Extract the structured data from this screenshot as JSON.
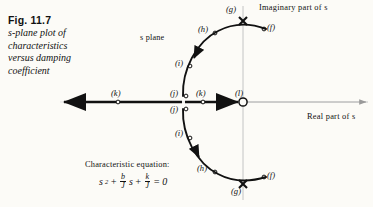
{
  "figure": {
    "number": "Fig. 11.7",
    "caption_lines": [
      "s-plane plot of",
      "characteristics",
      "versus damping",
      "coefficient"
    ],
    "plane_label": "s plane",
    "axes": {
      "imaginary_label": "Imaginary part of s",
      "real_label": "Real part of s"
    },
    "equation": {
      "title": "Characteristic equation:",
      "term1": "s",
      "term1_exp": "2",
      "plus1": "+",
      "frac1_num": "b",
      "frac1_den": "J",
      "frac1_tail": "s",
      "plus2": "+",
      "frac2_num": "k",
      "frac2_den": "J",
      "equals": "= 0",
      "plain": "s^2 + (b/J)s + (k/J) = 0"
    },
    "markers": [
      {
        "id": "f-upper",
        "label": "(f)",
        "kind": "open-circle",
        "x": 264,
        "y": 29,
        "lx": 268,
        "ly": 24
      },
      {
        "id": "g-upper",
        "label": "(g)",
        "kind": "cross",
        "x": 243,
        "y": 21,
        "lx": 227,
        "ly": 11
      },
      {
        "id": "h-upper",
        "label": "(h)",
        "kind": "open-circle",
        "x": 215,
        "y": 33,
        "lx": 199,
        "ly": 26
      },
      {
        "id": "i-upper",
        "label": "(i)",
        "kind": "open-circle",
        "x": 190,
        "y": 66,
        "lx": 175,
        "ly": 60
      },
      {
        "id": "j-upper",
        "label": "(j)",
        "kind": "open-circle",
        "x": 185,
        "y": 96,
        "lx": 170,
        "ly": 90
      },
      {
        "id": "j-lower",
        "label": "(j)",
        "kind": "open-circle",
        "x": 185,
        "y": 109,
        "lx": 170,
        "ly": 110
      },
      {
        "id": "i-lower",
        "label": "(i)",
        "kind": "open-circle",
        "x": 190,
        "y": 138,
        "lx": 175,
        "ly": 131
      },
      {
        "id": "h-lower",
        "label": "(h)",
        "kind": "open-circle",
        "x": 215,
        "y": 172,
        "lx": 199,
        "ly": 170
      },
      {
        "id": "g-lower",
        "label": "(g)",
        "kind": "cross",
        "x": 243,
        "y": 184,
        "lx": 230,
        "ly": 189
      },
      {
        "id": "f-lower",
        "label": "(f)",
        "kind": "open-circle",
        "x": 264,
        "y": 177,
        "lx": 268,
        "ly": 172
      },
      {
        "id": "k-left",
        "label": "(k)",
        "kind": "open-circle",
        "x": 118,
        "y": 102,
        "lx": 105,
        "ly": 90
      },
      {
        "id": "k-right",
        "label": "(k)",
        "kind": "open-circle",
        "x": 203,
        "y": 102,
        "lx": 190,
        "ly": 90
      },
      {
        "id": "l-origin",
        "label": "(l)",
        "kind": "open-circle-large",
        "x": 243,
        "y": 102,
        "lx": 233,
        "ly": 89
      }
    ],
    "colors": {
      "ink": "#111111",
      "paper": "#fcfbf7",
      "axis_light": "#b9b9b9"
    }
  }
}
